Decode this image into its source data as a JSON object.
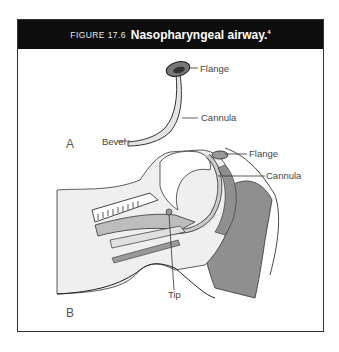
{
  "figure": {
    "number": "FIGURE 17.6",
    "title": "Nasopharyngeal airway.",
    "reference": "4"
  },
  "panel_a": {
    "label": "A",
    "callouts": [
      "Flange",
      "Cannula",
      "Bevel"
    ]
  },
  "panel_b": {
    "label": "B",
    "callouts": [
      "Flange",
      "Cannula",
      "Tip"
    ]
  },
  "colors": {
    "header_bg": "#0d0d0d",
    "tissue_dark": "#8f8f8f",
    "tissue_light": "#efefef",
    "outline": "#333333"
  }
}
